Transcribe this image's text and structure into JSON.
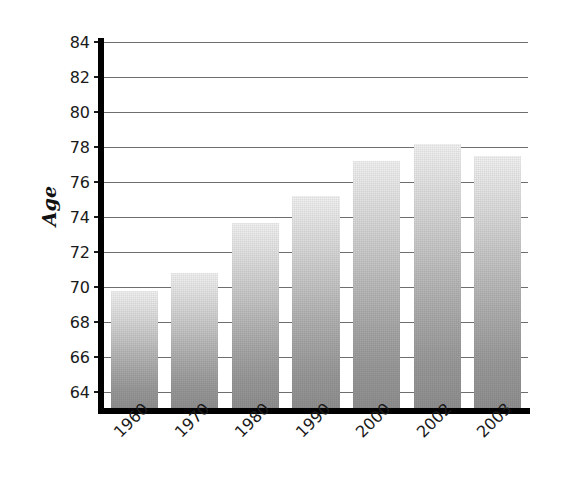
{
  "chart_data": {
    "type": "bar",
    "title": "",
    "subtitle": "",
    "xlabel": "",
    "ylabel": "Age",
    "categories": [
      "1960",
      "1970",
      "1980",
      "1990",
      "2000",
      "2002",
      "2003"
    ],
    "values": [
      69.8,
      70.8,
      73.7,
      75.2,
      77.2,
      78.2,
      77.5
    ],
    "series": [
      {
        "name": "Age",
        "values": [
          69.8,
          70.8,
          73.7,
          75.2,
          77.2,
          78.2,
          77.5
        ]
      }
    ],
    "ylim": [
      63.0,
      84.0
    ],
    "ytick_labels": [
      "64",
      "66",
      "68",
      "70",
      "72",
      "74",
      "76",
      "78",
      "80",
      "82",
      "84"
    ],
    "ytick_values": [
      64,
      66,
      68,
      70,
      72,
      74,
      76,
      78,
      80,
      82,
      84
    ],
    "ytick_step": 2,
    "grid": true,
    "grid_axis": "y",
    "legend": false,
    "legend_position": "none",
    "annotations": [],
    "bar_style": {
      "fill": "vertical-gradient-gray",
      "gradient_top": "#f2f2f2",
      "gradient_bottom": "#8f8f8f",
      "border": "none"
    },
    "axis_color": "#000000",
    "gridline_color": "#6e6e6e",
    "background": "#ffffff",
    "xtick_label_rotation": -45
  }
}
